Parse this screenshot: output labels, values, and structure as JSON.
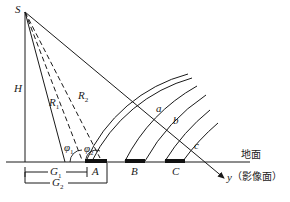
{
  "diagram": {
    "type": "side-looking radar geometry",
    "labels": {
      "source": "S",
      "height": "H",
      "r1": "R",
      "r1_sub": "1",
      "r2": "R",
      "r2_sub": "2",
      "phi1": "φ",
      "phi1_sub": "1",
      "phi2": "φ",
      "phi2_sub": "2",
      "point_a": "a",
      "point_b": "b",
      "point_c": "c",
      "target_A": "A",
      "target_B": "B",
      "target_C": "C",
      "g1": "G",
      "g1_sub": "1",
      "g2": "G",
      "g2_sub": "2",
      "ground": "地面",
      "image_axis": "y",
      "image_plane": "（影像面）"
    },
    "colors": {
      "stroke": "#1a1a1a",
      "background": "#ffffff"
    }
  }
}
